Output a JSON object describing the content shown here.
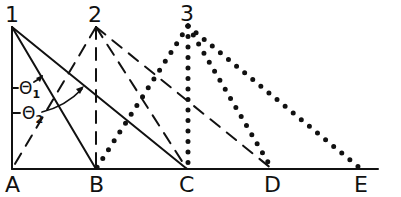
{
  "figure": {
    "type": "geometric diagram",
    "colors": {
      "ink": "#111111",
      "background": "#ffffff"
    },
    "apex_labels": [
      "1",
      "2",
      "3"
    ],
    "base_labels": [
      "A",
      "B",
      "C",
      "D",
      "E"
    ],
    "angle_labels": {
      "theta1": {
        "symbol": "Θ",
        "subscript": "1"
      },
      "theta2": {
        "symbol": "Θ",
        "subscript": "2"
      }
    },
    "line_styles": {
      "apex_1": "solid",
      "apex_2": "dashed",
      "apex_3": "dotted"
    },
    "segments": [
      {
        "from": "1",
        "to": "A",
        "style": "solid"
      },
      {
        "from": "1",
        "to": "B",
        "style": "solid"
      },
      {
        "from": "1",
        "to": "C",
        "style": "solid"
      },
      {
        "from": "2",
        "to": "A",
        "style": "dashed"
      },
      {
        "from": "2",
        "to": "B",
        "style": "dashed"
      },
      {
        "from": "2",
        "to": "C",
        "style": "dashed"
      },
      {
        "from": "2",
        "to": "D",
        "style": "dashed"
      },
      {
        "from": "3",
        "to": "B",
        "style": "dotted"
      },
      {
        "from": "3",
        "to": "C",
        "style": "dotted"
      },
      {
        "from": "3",
        "to": "D",
        "style": "dotted"
      },
      {
        "from": "3",
        "to": "E",
        "style": "dotted"
      },
      {
        "from": "A",
        "to": "E",
        "style": "solid"
      }
    ]
  }
}
